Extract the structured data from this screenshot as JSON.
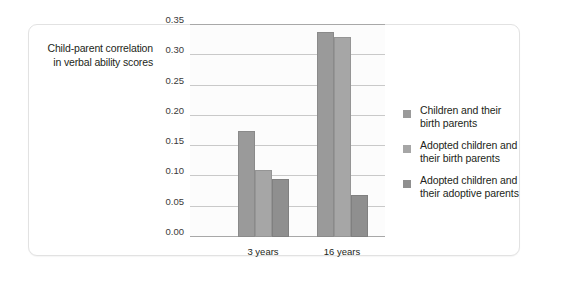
{
  "chart_data": {
    "type": "bar",
    "title": "",
    "subtitle": "",
    "xlabel": "",
    "ylabel": "Child-parent correlation in verbal ability scores",
    "ylabel_lines": [
      "Child-parent correlation",
      "in verbal ability scores"
    ],
    "categories": [
      "3 years",
      "16 years"
    ],
    "series": [
      {
        "name": "Children and their birth parents",
        "name_lines": [
          "Children and their",
          "birth parents"
        ],
        "color": "#9a9a9a",
        "values": [
          0.175,
          0.338
        ]
      },
      {
        "name": "Adopted children and their birth parents",
        "name_lines": [
          "Adopted children and",
          "their birth parents"
        ],
        "color": "#a6a6a6",
        "values": [
          0.11,
          0.33
        ]
      },
      {
        "name": "Adopted children and their adoptive parents",
        "name_lines": [
          "Adopted children and",
          "their adoptive parents"
        ],
        "color": "#8f8f8f",
        "values": [
          0.096,
          0.069
        ]
      }
    ],
    "ylim": [
      0.0,
      0.35
    ],
    "ytick_values": [
      0.0,
      0.05,
      0.1,
      0.15,
      0.2,
      0.25,
      0.3,
      0.35
    ],
    "ytick_labels": [
      "0.00",
      "0.05",
      "0.10",
      "0.15",
      "0.20",
      "0.25",
      "0.30",
      "0.35"
    ],
    "grid": true,
    "grid_axis": "y",
    "legend_position": "right",
    "plot_background": "#fcfcfc",
    "gridline_color": "#c9c9c9",
    "axis_color": "#a8a8a8"
  }
}
